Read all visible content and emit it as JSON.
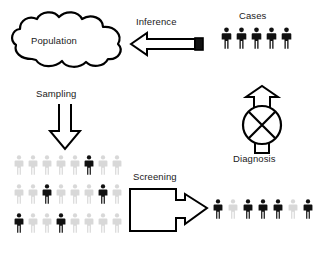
{
  "diagram": {
    "background_color": "#ffffff",
    "stroke_color": "#000000",
    "label_color": "#1a1a1a",
    "person_dark_color": "#111111",
    "person_light_color": "#d8d8d8"
  },
  "labels": {
    "population": "Population",
    "inference": "Inference",
    "cases": "Cases",
    "sampling": "Sampling",
    "diagnosis": "Diagnosis",
    "screening": "Screening"
  },
  "nodes": {
    "population_cloud": {
      "label": "Population",
      "shape": "cloud",
      "fill": "#ffffff",
      "stroke": "#000000"
    },
    "diagnosis_symbol": {
      "label": "Diagnosis",
      "shape": "circle-with-x-and-up-arrow",
      "fill": "#ffffff",
      "stroke": "#000000"
    }
  },
  "arrows": {
    "inference": {
      "label": "Inference",
      "direction": "left",
      "style": "hollow-block-arrow-with-solid-tail-cap",
      "fill": "#ffffff",
      "cap_fill": "#111111"
    },
    "sampling": {
      "label": "Sampling",
      "direction": "down",
      "style": "hollow-arrow",
      "fill": "#ffffff"
    },
    "screening": {
      "label": "Screening",
      "direction": "right",
      "style": "hollow-box-with-arrow-head",
      "fill": "#ffffff"
    },
    "diagnosis_up": {
      "direction": "up",
      "style": "hollow-arrow",
      "fill": "#ffffff"
    }
  },
  "people_groups": {
    "cases": {
      "label": "Cases",
      "count": 5,
      "states": [
        "dark",
        "dark",
        "dark",
        "dark",
        "dark"
      ]
    },
    "sample_grid": {
      "rows": 3,
      "columns": 8,
      "count": 24,
      "states": [
        [
          "light",
          "light",
          "light",
          "light",
          "light",
          "dark",
          "light",
          "light"
        ],
        [
          "light",
          "light",
          "dark",
          "light",
          "light",
          "light",
          "dark",
          "light"
        ],
        [
          "dark",
          "light",
          "light",
          "dark",
          "light",
          "light",
          "light",
          "light"
        ]
      ]
    },
    "screened": {
      "count": 8,
      "states": [
        "dark",
        "light",
        "dark",
        "dark",
        "dark",
        "light",
        "dark",
        "dark"
      ]
    }
  }
}
